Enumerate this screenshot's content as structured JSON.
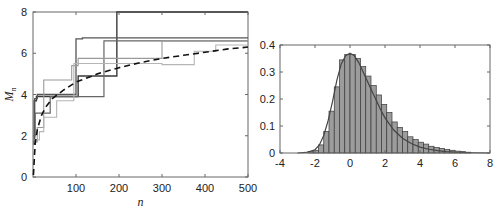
{
  "chart_data": [
    {
      "type": "line",
      "title": "",
      "xlabel": "n",
      "ylabel": "M_n",
      "xlim": [
        0,
        500
      ],
      "ylim": [
        0,
        8
      ],
      "xticks": [
        100,
        200,
        300,
        400,
        500
      ],
      "yticks": [
        0,
        2,
        4,
        6,
        8
      ],
      "grid": false,
      "legend": null,
      "series": [
        {
          "name": "run 1",
          "style": "step",
          "color": "#3a3a3a",
          "width": 1.4,
          "points": [
            [
              1,
              1.6
            ],
            [
              3,
              3.7
            ],
            [
              8,
              3.9
            ],
            [
              105,
              3.9
            ],
            [
              105,
              4.9
            ],
            [
              195,
              4.9
            ],
            [
              195,
              8.0
            ],
            [
              500,
              8.0
            ]
          ]
        },
        {
          "name": "run 2",
          "style": "step",
          "color": "#555555",
          "width": 1.3,
          "points": [
            [
              1,
              1.7
            ],
            [
              4,
              3.8
            ],
            [
              10,
              4.0
            ],
            [
              100,
              4.0
            ],
            [
              100,
              6.7
            ],
            [
              115,
              6.7
            ],
            [
              115,
              6.75
            ],
            [
              500,
              6.75
            ]
          ]
        },
        {
          "name": "run 3",
          "style": "step",
          "color": "#666666",
          "width": 1.2,
          "points": [
            [
              1,
              2.0
            ],
            [
              5,
              3.1
            ],
            [
              40,
              3.1
            ],
            [
              40,
              3.9
            ],
            [
              165,
              3.9
            ],
            [
              165,
              6.6
            ],
            [
              500,
              6.6
            ]
          ]
        },
        {
          "name": "run 4",
          "style": "step",
          "color": "#9a9a9a",
          "width": 1.1,
          "points": [
            [
              2,
              1.7
            ],
            [
              10,
              2.4
            ],
            [
              25,
              2.4
            ],
            [
              25,
              4.7
            ],
            [
              90,
              4.7
            ],
            [
              90,
              5.4
            ],
            [
              105,
              5.4
            ],
            [
              105,
              5.75
            ],
            [
              300,
              5.75
            ],
            [
              300,
              6.6
            ],
            [
              500,
              6.6
            ]
          ]
        },
        {
          "name": "run 5",
          "style": "step",
          "color": "#b5b5b5",
          "width": 1.1,
          "points": [
            [
              3,
              1.8
            ],
            [
              15,
              2.2
            ],
            [
              25,
              2.2
            ],
            [
              25,
              2.9
            ],
            [
              55,
              2.9
            ],
            [
              55,
              3.7
            ],
            [
              95,
              3.7
            ],
            [
              95,
              5.5
            ],
            [
              300,
              5.5
            ],
            [
              300,
              5.45
            ],
            [
              375,
              5.45
            ],
            [
              375,
              6.1
            ],
            [
              425,
              6.1
            ],
            [
              425,
              6.4
            ],
            [
              500,
              6.4
            ]
          ]
        },
        {
          "name": "expected",
          "style": "dashed",
          "color": "#111111",
          "width": 1.6,
          "points": [
            [
              1,
              0.1
            ],
            [
              5,
              1.6
            ],
            [
              10,
              2.3
            ],
            [
              20,
              3.0
            ],
            [
              30,
              3.4
            ],
            [
              45,
              3.8
            ],
            [
              70,
              4.2
            ],
            [
              100,
              4.6
            ],
            [
              150,
              5.0
            ],
            [
              200,
              5.3
            ],
            [
              250,
              5.55
            ],
            [
              300,
              5.75
            ],
            [
              350,
              5.9
            ],
            [
              400,
              6.05
            ],
            [
              450,
              6.2
            ],
            [
              500,
              6.3
            ]
          ]
        }
      ]
    },
    {
      "type": "bar",
      "title": "",
      "xlabel": "",
      "ylabel": "",
      "xlim": [
        -4,
        8
      ],
      "ylim": [
        0,
        0.4
      ],
      "xticks": [
        -4,
        -2,
        0,
        2,
        4,
        6,
        8
      ],
      "yticks": [
        0,
        0.1,
        0.2,
        0.3,
        0.4
      ],
      "ytick_labels": [
        "0",
        "0.1",
        "0.2",
        "0.3",
        "0.4"
      ],
      "grid": false,
      "bar_color": "#9c9c9c",
      "bar_edge": "#3a3a3a",
      "bin_width": 0.3,
      "bin_start": -2.4,
      "values": [
        0.005,
        0.01,
        0.03,
        0.08,
        0.155,
        0.245,
        0.345,
        0.365,
        0.365,
        0.35,
        0.32,
        0.285,
        0.25,
        0.215,
        0.18,
        0.15,
        0.115,
        0.095,
        0.08,
        0.06,
        0.05,
        0.04,
        0.033,
        0.025,
        0.02,
        0.017,
        0.013,
        0.01,
        0.007,
        0.005,
        0.003
      ],
      "curve": {
        "name": "density fit",
        "color": "#444444",
        "x": [
          -3,
          -2.5,
          -2,
          -1.75,
          -1.5,
          -1.25,
          -1,
          -0.75,
          -0.5,
          -0.25,
          0,
          0.25,
          0.5,
          0.75,
          1,
          1.25,
          1.5,
          1.75,
          2,
          2.5,
          3,
          3.5,
          4,
          4.5,
          5,
          5.5,
          6,
          7,
          8
        ],
        "y": [
          0,
          0.002,
          0.012,
          0.03,
          0.065,
          0.12,
          0.19,
          0.27,
          0.33,
          0.36,
          0.37,
          0.36,
          0.335,
          0.3,
          0.265,
          0.23,
          0.195,
          0.16,
          0.13,
          0.085,
          0.055,
          0.035,
          0.022,
          0.014,
          0.009,
          0.005,
          0.003,
          0.001,
          0
        ]
      }
    }
  ]
}
